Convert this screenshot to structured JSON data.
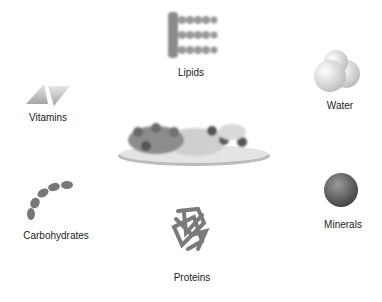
{
  "diagram": {
    "center": {
      "name": "food-plate"
    },
    "nutrients": [
      {
        "label": "Lipids"
      },
      {
        "label": "Water"
      },
      {
        "label": "Vitamins"
      },
      {
        "label": "Carbohydrates"
      },
      {
        "label": "Proteins"
      },
      {
        "label": "Minerals"
      }
    ]
  }
}
